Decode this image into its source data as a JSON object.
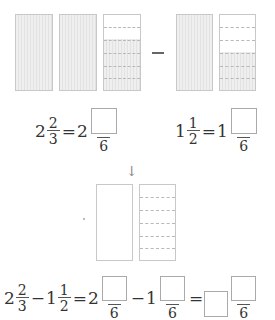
{
  "top_models": {
    "left_group": {
      "wholes": 2,
      "partial": {
        "parts": 6,
        "shaded_parts": 4
      }
    },
    "operator": "−",
    "right_group": {
      "wholes": 1,
      "partial": {
        "parts": 6,
        "shaded_parts": 3
      }
    }
  },
  "conversion_1": {
    "whole": "2",
    "num": "2",
    "den": "3",
    "equals": "=",
    "result_whole": "2",
    "result_den": "6"
  },
  "conversion_2": {
    "whole": "1",
    "num": "1",
    "den": "2",
    "equals": "=",
    "result_whole": "1",
    "result_den": "6"
  },
  "arrow_icon": "↓",
  "result_model": {
    "wholes": 1,
    "partial": {
      "parts": 6,
      "shaded_parts": 0
    }
  },
  "final_equation": {
    "a_whole": "2",
    "a_num": "2",
    "a_den": "3",
    "minus": "−",
    "b_whole": "1",
    "b_num": "1",
    "b_den": "2",
    "eq1": "=",
    "c_whole": "2",
    "c_den": "6",
    "minus2": "−",
    "d_whole": "1",
    "d_den": "6",
    "eq2": "=",
    "e_den": "6"
  },
  "colors": {
    "shade": "#e6e6e6",
    "border": "#c8c8c8",
    "text": "#333333"
  }
}
